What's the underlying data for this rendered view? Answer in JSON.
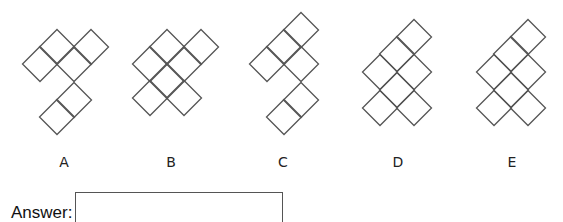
{
  "question": {
    "options": [
      {
        "label": "A",
        "label_x": 64,
        "cells": [
          [
            57,
            47
          ],
          [
            91,
            47
          ],
          [
            40,
            64
          ],
          [
            74,
            64
          ],
          [
            74,
            100
          ],
          [
            57,
            117
          ]
        ]
      },
      {
        "label": "B",
        "label_x": 171,
        "cells": [
          [
            167,
            47
          ],
          [
            201,
            47
          ],
          [
            150,
            64
          ],
          [
            184,
            64
          ],
          [
            167,
            81
          ],
          [
            150,
            98
          ],
          [
            184,
            98
          ]
        ]
      },
      {
        "label": "C",
        "label_x": 283,
        "cells": [
          [
            301,
            30
          ],
          [
            284,
            47
          ],
          [
            267,
            64
          ],
          [
            301,
            64
          ],
          [
            301,
            100
          ],
          [
            284,
            117
          ]
        ]
      },
      {
        "label": "D",
        "label_x": 398,
        "cells": [
          [
            414,
            37
          ],
          [
            397,
            54
          ],
          [
            380,
            72
          ],
          [
            414,
            72
          ],
          [
            397,
            90
          ],
          [
            380,
            108
          ],
          [
            414,
            108
          ]
        ]
      },
      {
        "label": "E",
        "label_x": 512,
        "cells": [
          [
            528,
            37
          ],
          [
            511,
            54
          ],
          [
            494,
            72
          ],
          [
            528,
            72
          ],
          [
            511,
            90
          ],
          [
            494,
            108
          ],
          [
            528,
            108
          ]
        ]
      }
    ],
    "cell_half_diagonal": 17.5,
    "stroke_color": "#555555"
  },
  "answer": {
    "label": "Answer:",
    "value": ""
  }
}
